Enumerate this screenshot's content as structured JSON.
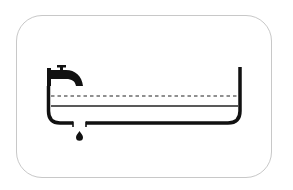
{
  "diagram": {
    "colors": {
      "background": "#ffffff",
      "frame_border": "#c8c8c8",
      "ink": "#111111"
    },
    "elements": [
      {
        "name": "faucet",
        "role": "inflow"
      },
      {
        "name": "tank",
        "role": "container"
      },
      {
        "name": "dashed-level-line",
        "role": "upper water level"
      },
      {
        "name": "solid-level-line",
        "role": "current water level"
      },
      {
        "name": "drain-opening",
        "role": "outflow"
      },
      {
        "name": "water-drop",
        "role": "outflow drip"
      }
    ]
  }
}
